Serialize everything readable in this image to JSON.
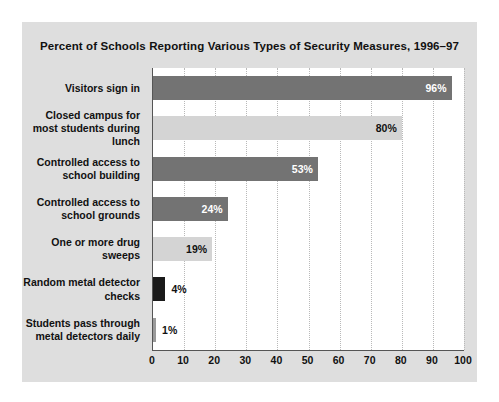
{
  "chart_data": {
    "type": "bar",
    "orientation": "horizontal",
    "title": "Percent of Schools Reporting Various Types of Security Measures, 1996–97",
    "xlabel": "",
    "ylabel": "",
    "xlim": [
      0,
      100
    ],
    "xticks": [
      "0",
      "10",
      "20",
      "30",
      "40",
      "50",
      "60",
      "70",
      "80",
      "90",
      "100"
    ],
    "grid": "vertical-dotted",
    "legend": "none",
    "value_suffix": "%",
    "categories": [
      "Visitors sign in",
      "Closed campus for most students during lunch",
      "Controlled access to school building",
      "Controlled access to school grounds",
      "One or more drug sweeps",
      "Random metal detector checks",
      "Students pass through metal detectors daily"
    ],
    "values": [
      96,
      80,
      53,
      24,
      19,
      4,
      1
    ],
    "labels": [
      "96%",
      "80%",
      "53%",
      "24%",
      "19%",
      "4%",
      "1%"
    ],
    "bar_colors": [
      "#737373",
      "#d4d4d4",
      "#737373",
      "#737373",
      "#d4d4d4",
      "#1a1a1a",
      "#9a9a9a"
    ],
    "label_colors": [
      "#ffffff",
      "#111111",
      "#ffffff",
      "#ffffff",
      "#111111",
      "#111111",
      "#111111"
    ],
    "label_placement": [
      "inside",
      "inside",
      "inside",
      "inside",
      "inside",
      "outside",
      "outside"
    ]
  },
  "colors": {
    "card_background": "#dedede",
    "plot_background": "#ffffff",
    "axis_line": "#555555",
    "gridline": "#b9b9b9",
    "text": "#111111",
    "bar_dark": "#737373",
    "bar_light": "#d4d4d4",
    "bar_black": "#1a1a1a",
    "bar_medium": "#9a9a9a"
  }
}
